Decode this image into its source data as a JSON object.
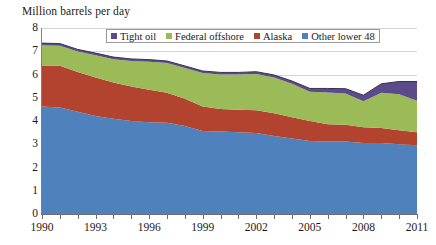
{
  "chart_data": {
    "type": "area",
    "stacked": true,
    "title": "Million barrels per day",
    "xlabel": "",
    "ylabel": "Million barrels per day",
    "ylim": [
      0,
      8
    ],
    "xlim": [
      1990,
      2011
    ],
    "y_ticks": [
      0,
      1,
      2,
      3,
      4,
      5,
      6,
      7,
      8
    ],
    "x_ticks": [
      1990,
      1993,
      1996,
      1999,
      2002,
      2005,
      2008,
      2011
    ],
    "x_tick_labels": [
      "1990",
      "1993",
      "1996",
      "1999",
      "2002",
      "2005",
      "2008",
      "2011"
    ],
    "x_minor_ticks_every": 1,
    "grid": "horizontal",
    "legend_position": "top-center",
    "x": [
      1990,
      1991,
      1992,
      1993,
      1994,
      1995,
      1996,
      1997,
      1998,
      1999,
      2000,
      2001,
      2002,
      2003,
      2004,
      2005,
      2006,
      2007,
      2008,
      2009,
      2010,
      2011
    ],
    "series": [
      {
        "name": "Other lower 48",
        "color": "#4F81BD",
        "values": [
          4.62,
          4.58,
          4.4,
          4.22,
          4.1,
          4.0,
          3.95,
          3.92,
          3.78,
          3.57,
          3.55,
          3.52,
          3.48,
          3.36,
          3.25,
          3.14,
          3.12,
          3.12,
          3.05,
          3.05,
          3.0,
          2.96
        ]
      },
      {
        "name": "Alaska",
        "color": "#B1432F",
        "values": [
          1.77,
          1.8,
          1.71,
          1.65,
          1.56,
          1.48,
          1.39,
          1.3,
          1.18,
          1.05,
          0.97,
          0.96,
          0.98,
          0.97,
          0.91,
          0.86,
          0.74,
          0.72,
          0.68,
          0.65,
          0.6,
          0.56
        ]
      },
      {
        "name": "Federal offshore",
        "color": "#9BBB59",
        "values": [
          0.87,
          0.86,
          0.88,
          0.96,
          1.0,
          1.1,
          1.21,
          1.27,
          1.32,
          1.44,
          1.48,
          1.52,
          1.56,
          1.54,
          1.44,
          1.26,
          1.37,
          1.34,
          1.12,
          1.52,
          1.55,
          1.35
        ]
      },
      {
        "name": "Tight oil",
        "color": "#5B4B8A",
        "values": [
          0.09,
          0.09,
          0.09,
          0.09,
          0.09,
          0.09,
          0.09,
          0.09,
          0.09,
          0.09,
          0.09,
          0.09,
          0.1,
          0.11,
          0.12,
          0.14,
          0.17,
          0.21,
          0.26,
          0.38,
          0.55,
          0.83
        ]
      }
    ],
    "legend": [
      {
        "label": "Tight oil",
        "color": "#5B4B8A"
      },
      {
        "label": "Federal offshore",
        "color": "#9BBB59"
      },
      {
        "label": "Alaska",
        "color": "#B1432F"
      },
      {
        "label": "Other lower 48",
        "color": "#4F81BD"
      }
    ]
  }
}
